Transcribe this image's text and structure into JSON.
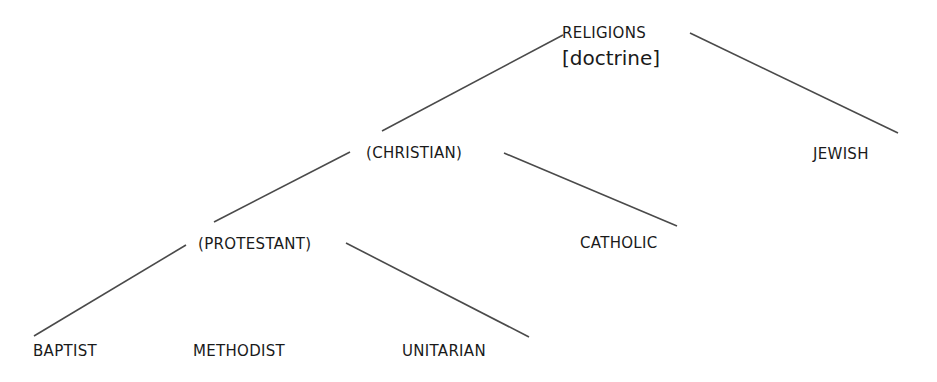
{
  "diagram": {
    "type": "tree",
    "root": {
      "label": "RELIGIONS",
      "annotation": "[doctrine]"
    },
    "nodes": {
      "religions": "RELIGIONS",
      "doctrine": "[doctrine]",
      "christian": "(CHRISTIAN)",
      "jewish": "JEWISH",
      "protestant": "(PROTESTANT)",
      "catholic": "CATHOLIC",
      "baptist": "BAPTIST",
      "methodist": "METHODIST",
      "unitarian": "UNITARIAN"
    },
    "edges": [
      {
        "from": "RELIGIONS",
        "to": "(CHRISTIAN)"
      },
      {
        "from": "RELIGIONS",
        "to": "JEWISH"
      },
      {
        "from": "(CHRISTIAN)",
        "to": "(PROTESTANT)"
      },
      {
        "from": "(CHRISTIAN)",
        "to": "CATHOLIC"
      },
      {
        "from": "(PROTESTANT)",
        "to": "BAPTIST"
      },
      {
        "from": "(PROTESTANT)",
        "to": "UNITARIAN"
      }
    ],
    "line_color": "#4a4a4a"
  }
}
